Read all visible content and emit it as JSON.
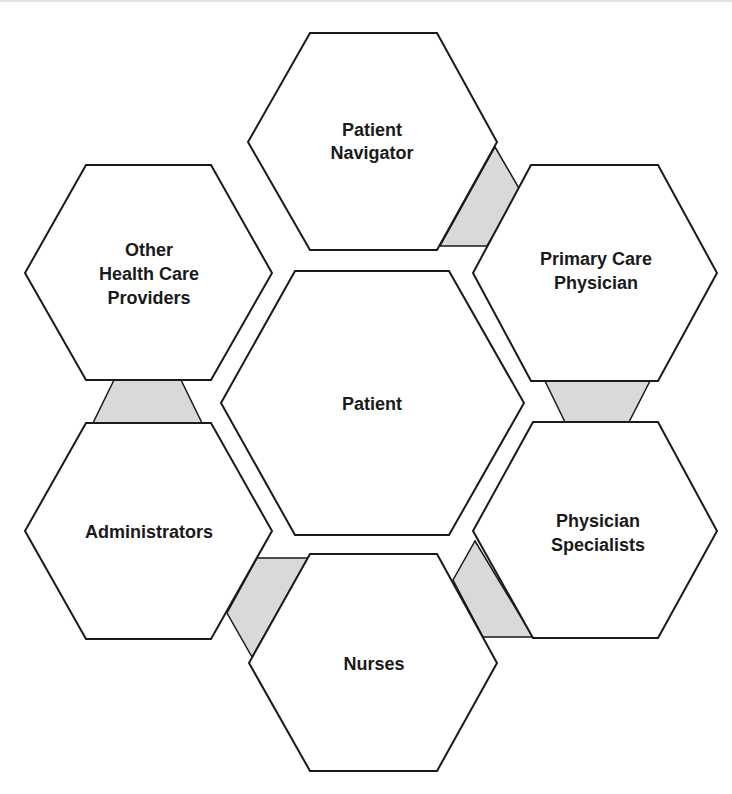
{
  "diagram": {
    "title": "",
    "colors": {
      "background": "#ffffff",
      "hex_fill": "#ffffff",
      "stroke": "#1a1a1a",
      "connector_fill": "#d9d9d9"
    },
    "center": {
      "id": "patient",
      "lines": [
        "Patient"
      ]
    },
    "nodes": [
      {
        "id": "patient-navigator",
        "lines": [
          "Patient",
          "Navigator"
        ]
      },
      {
        "id": "primary-care-physician",
        "lines": [
          "Primary Care",
          "Physician"
        ]
      },
      {
        "id": "physician-specialists",
        "lines": [
          "Physician",
          "Specialists"
        ]
      },
      {
        "id": "nurses",
        "lines": [
          "Nurses"
        ]
      },
      {
        "id": "administrators",
        "lines": [
          "Administrators"
        ]
      },
      {
        "id": "other-health-care-providers",
        "lines": [
          "Other",
          "Health Care",
          "Providers"
        ]
      }
    ],
    "connectors": [
      {
        "from": "patient-navigator",
        "to": "primary-care-physician"
      },
      {
        "from": "primary-care-physician",
        "to": "physician-specialists"
      },
      {
        "from": "physician-specialists",
        "to": "nurses"
      },
      {
        "from": "nurses",
        "to": "administrators"
      },
      {
        "from": "administrators",
        "to": "other-health-care-providers"
      }
    ]
  }
}
